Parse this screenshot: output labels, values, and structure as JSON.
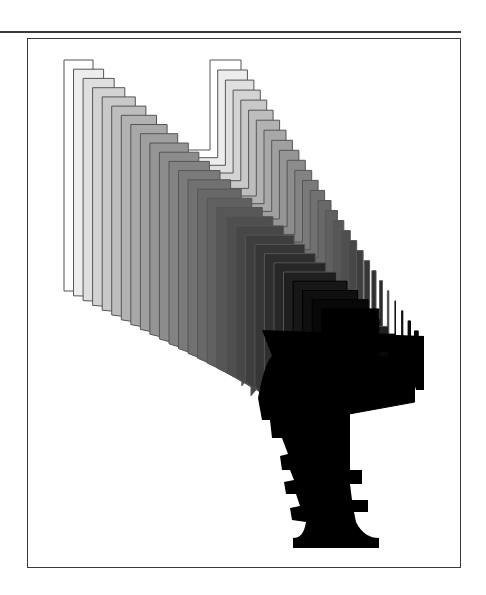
{
  "figure": {
    "layer_count": 28,
    "start_offset": [
      0,
      0
    ],
    "step": [
      8.2,
      8.2
    ],
    "fill_start": "#ffffff",
    "fill_end": "#000000",
    "stroke_color": "#555555",
    "frame_color": "#3a3a3a",
    "shape_start": {
      "name": "U-form",
      "points": [
        [
          64,
          60
        ],
        [
          93,
          60
        ],
        [
          93,
          150
        ],
        [
          210,
          150
        ],
        [
          210,
          60
        ],
        [
          241,
          60
        ],
        [
          241,
          162
        ],
        [
          93,
          162
        ],
        [
          93,
          196
        ],
        [
          88,
          218
        ],
        [
          88,
          291
        ],
        [
          64,
          291
        ]
      ]
    },
    "shape_end": {
      "name": "T-form",
      "points": [
        [
          130,
          110
        ],
        [
          210,
          110
        ],
        [
          210,
          124
        ],
        [
          186,
          124
        ],
        [
          186,
          150
        ],
        [
          154,
          150
        ],
        [
          154,
          196
        ],
        [
          154,
          218
        ],
        [
          154,
          300
        ],
        [
          130,
          300
        ],
        [
          130,
          150
        ],
        [
          130,
          124
        ]
      ]
    }
  }
}
